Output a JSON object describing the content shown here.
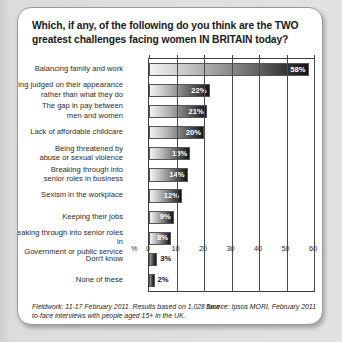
{
  "title": "Which, if any, of the following do you think are the TWO greatest challenges facing women IN BRITAIN today?",
  "footer": {
    "fieldwork": "Fieldwork: 11-17 February 2011. Results based on 1,028 face-to-face interviews with people aged 15+ in the UK.",
    "source": "Source: Ipsos MORI, February 2011"
  },
  "axis": {
    "percent_symbol": "%",
    "ticks": [
      "0",
      "10",
      "20",
      "30",
      "40",
      "50",
      "60"
    ]
  },
  "chart_data": {
    "type": "bar",
    "orientation": "horizontal",
    "title": "Which, if any, of the following do you think are the TWO greatest challenges facing women IN BRITAIN today?",
    "xlabel": "%",
    "ylabel": "",
    "xlim": [
      0,
      60
    ],
    "grid": true,
    "legend": "none",
    "categories": [
      "Balancing family and work",
      "Being judged on their appearance rather than what they do",
      "The gap in pay between men and women",
      "Lack of affordable childcare",
      "Being threatened by abuse or sexual violence",
      "Breaking through into senior roles in business",
      "Sexism in the workplace",
      "Keeping their jobs",
      "Breaking through into senior roles in Government or public service",
      "Don't know",
      "None of these"
    ],
    "values": [
      58,
      22,
      21,
      20,
      15,
      14,
      12,
      9,
      8,
      3,
      2
    ],
    "data_labels": [
      "58%",
      "22%",
      "21%",
      "20%",
      "15%",
      "14%",
      "12%",
      "9%",
      "8%",
      "3%",
      "2%"
    ]
  },
  "rows": [
    {
      "label_line1": "Balancing family and work",
      "label_line2": "",
      "value": 58,
      "text": "58%",
      "inside": true
    },
    {
      "label_line1": "Being judged on their appearance",
      "label_line2": "rather than what they do",
      "value": 22,
      "text": "22%",
      "inside": true
    },
    {
      "label_line1": "The gap in pay between",
      "label_line2": "men and women",
      "value": 21,
      "text": "21%",
      "inside": true
    },
    {
      "label_line1": "Lack of affordable childcare",
      "label_line2": "",
      "value": 20,
      "text": "20%",
      "inside": true
    },
    {
      "label_line1": "Being threatened by",
      "label_line2": "abuse or sexual violence",
      "value": 15,
      "text": "15%",
      "inside": true
    },
    {
      "label_line1": "Breaking through into",
      "label_line2": "senior roles in business",
      "value": 14,
      "text": "14%",
      "inside": true
    },
    {
      "label_line1": "Sexism in the workplace",
      "label_line2": "",
      "value": 12,
      "text": "12%",
      "inside": true
    },
    {
      "label_line1": "Keeping their jobs",
      "label_line2": "",
      "value": 9,
      "text": "9%",
      "inside": true
    },
    {
      "label_line1": "Breaking through into senior roles in",
      "label_line2": "Government or public service",
      "value": 8,
      "text": "8%",
      "inside": true
    },
    {
      "label_line1": "Don't know",
      "label_line2": "",
      "value": 3,
      "text": "3%",
      "inside": false
    },
    {
      "label_line1": "None of these",
      "label_line2": "",
      "value": 2,
      "text": "2%",
      "inside": false
    }
  ]
}
